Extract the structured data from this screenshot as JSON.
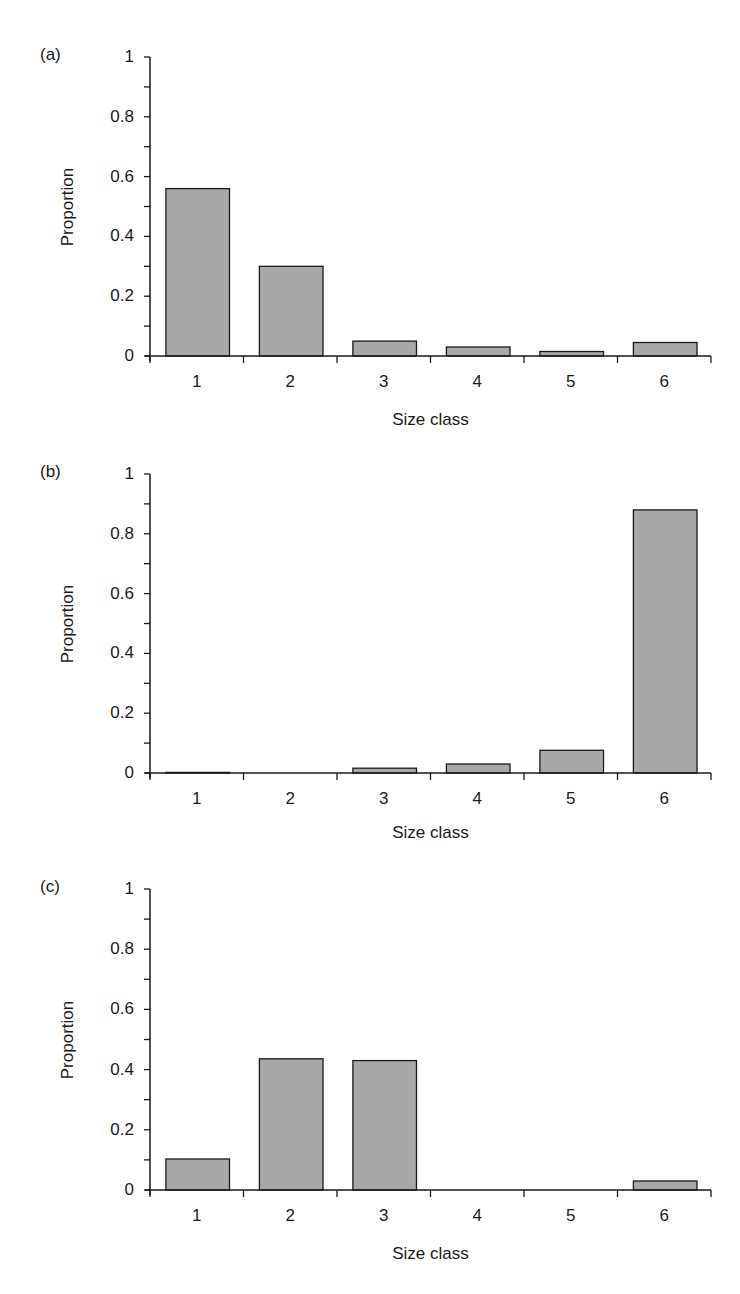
{
  "figure": {
    "panels": [
      {
        "id": "a",
        "label": "(a)",
        "ylabel": "Proportion",
        "xlabel": "Size class",
        "yticks": [
          "0",
          "0.2",
          "0.4",
          "0.6",
          "0.8",
          "1"
        ],
        "xticks": [
          "1",
          "2",
          "3",
          "4",
          "5",
          "6"
        ]
      },
      {
        "id": "b",
        "label": "(b)",
        "ylabel": "Proportion",
        "xlabel": "Size class",
        "yticks": [
          "0",
          "0.2",
          "0.4",
          "0.6",
          "0.8",
          "1"
        ],
        "xticks": [
          "1",
          "2",
          "3",
          "4",
          "5",
          "6"
        ]
      },
      {
        "id": "c",
        "label": "(c)",
        "ylabel": "Proportion",
        "xlabel": "Size class",
        "yticks": [
          "0",
          "0.2",
          "0.4",
          "0.6",
          "0.8",
          "1"
        ],
        "xticks": [
          "1",
          "2",
          "3",
          "4",
          "5",
          "6"
        ]
      }
    ],
    "colors": {
      "bar_fill": "#a8a8a8",
      "bar_stroke": "#1a1a1a",
      "axis": "#1a1a1a"
    }
  },
  "chart_data": [
    {
      "type": "bar",
      "title": "(a)",
      "categories": [
        "1",
        "2",
        "3",
        "4",
        "5",
        "6"
      ],
      "values": [
        0.56,
        0.3,
        0.05,
        0.03,
        0.015,
        0.045
      ],
      "xlabel": "Size class",
      "ylabel": "Proportion",
      "ylim": [
        0,
        1
      ],
      "yticks": [
        0,
        0.2,
        0.4,
        0.6,
        0.8,
        1
      ],
      "minor_yticks": 0.1,
      "grid": false,
      "legend": null
    },
    {
      "type": "bar",
      "title": "(b)",
      "categories": [
        "1",
        "2",
        "3",
        "4",
        "5",
        "6"
      ],
      "values": [
        0.002,
        0.001,
        0.016,
        0.03,
        0.076,
        0.88
      ],
      "xlabel": "Size class",
      "ylabel": "Proportion",
      "ylim": [
        0,
        1
      ],
      "yticks": [
        0,
        0.2,
        0.4,
        0.6,
        0.8,
        1
      ],
      "minor_yticks": 0.1,
      "grid": false,
      "legend": null
    },
    {
      "type": "bar",
      "title": "(c)",
      "categories": [
        "1",
        "2",
        "3",
        "4",
        "5",
        "6"
      ],
      "values": [
        0.103,
        0.436,
        0.43,
        0.0,
        0.0,
        0.03
      ],
      "xlabel": "Size class",
      "ylabel": "Proportion",
      "ylim": [
        0,
        1
      ],
      "yticks": [
        0,
        0.2,
        0.4,
        0.6,
        0.8,
        1
      ],
      "minor_yticks": 0.1,
      "grid": false,
      "legend": null
    }
  ]
}
